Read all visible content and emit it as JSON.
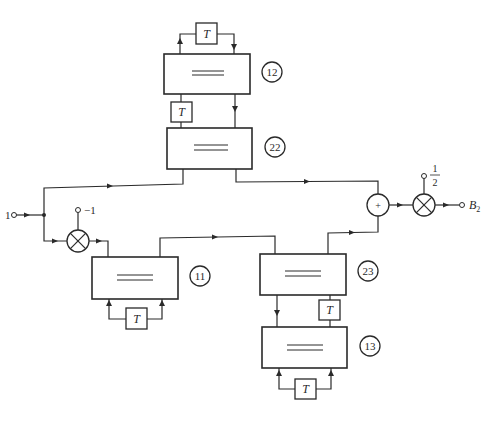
{
  "diagram": {
    "input": {
      "label": "1"
    },
    "output": {
      "label": "B",
      "subscript": "2"
    },
    "multipliers": [
      {
        "id": "neg-mult",
        "coefficient": "−1"
      },
      {
        "id": "half-mult",
        "coefficient_num": "1",
        "coefficient_den": "2"
      }
    ],
    "summer": {
      "symbol": "+"
    },
    "blocks": [
      {
        "id": "12",
        "label": "12",
        "delay": "T"
      },
      {
        "id": "22",
        "label": "22",
        "delay": "T"
      },
      {
        "id": "11",
        "label": "11",
        "delay": "T"
      },
      {
        "id": "23",
        "label": "23",
        "delay": "T"
      },
      {
        "id": "13",
        "label": "13",
        "delay": "T"
      }
    ]
  }
}
